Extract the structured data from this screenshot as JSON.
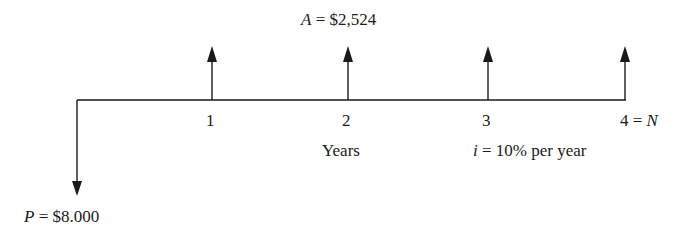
{
  "diagram": {
    "type": "cash-flow-diagram",
    "annuity_label": {
      "var": "A",
      "eq": " = ",
      "value": "$2,524"
    },
    "present_label": {
      "var": "P",
      "eq": " = ",
      "value": "$8.000"
    },
    "period_ticks": [
      "1",
      "2",
      "3"
    ],
    "last_tick": {
      "num": "4",
      "eq": " = ",
      "var": "N"
    },
    "axis_label": "Years",
    "rate_label": {
      "var": "i",
      "rest": " = 10% per year"
    },
    "upward_arrows_at_periods": [
      1,
      2,
      3,
      4
    ],
    "downward_arrow_at_period": 0,
    "line_color": "#1a1a1a"
  }
}
